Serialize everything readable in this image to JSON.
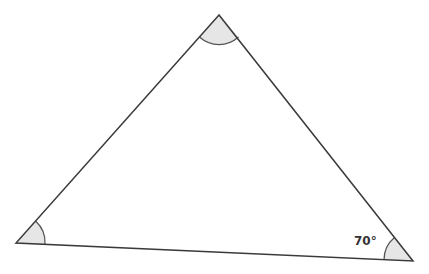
{
  "diagram": {
    "type": "triangle",
    "vertices": {
      "top": [
        219,
        15
      ],
      "bottom_left": [
        16,
        243
      ],
      "bottom_right": [
        413,
        261
      ]
    },
    "angles": [
      {
        "vertex": "top",
        "label": ""
      },
      {
        "vertex": "bottom_left",
        "label": ""
      },
      {
        "vertex": "bottom_right",
        "label": "70°"
      }
    ],
    "colors": {
      "stroke": "#3a3a3a",
      "arc_fill": "#e6e6e6",
      "arc_stroke": "#555555",
      "text": "#333333"
    }
  }
}
